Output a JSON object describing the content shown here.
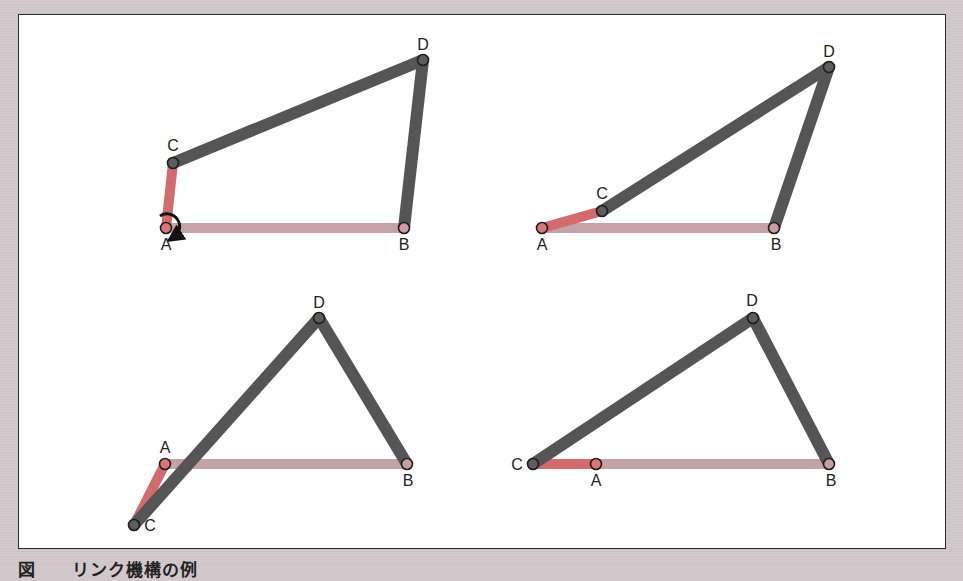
{
  "figure": {
    "caption": "図　　リンク機構の例",
    "colors": {
      "background": "#d3c9cc",
      "frame_bg": "#ffffff",
      "frame_border": "#2a2a2a",
      "fixed_link": "#c4a2a6",
      "crank_link": "#d26a6e",
      "moving_link": "#555555",
      "joint_moving": "#5c5c5c",
      "joint_fixed": "#c89ea3",
      "joint_crank": "#d9767a",
      "text": "#222222"
    },
    "panels": [
      {
        "id": "top-left",
        "joints": {
          "A": {
            "x": 166,
            "y": 228,
            "label": "A"
          },
          "B": {
            "x": 404,
            "y": 228,
            "label": "B"
          },
          "C": {
            "x": 173,
            "y": 163,
            "label": "C"
          },
          "D": {
            "x": 423,
            "y": 60,
            "label": "D"
          }
        },
        "rotation_arrow": true
      },
      {
        "id": "top-right",
        "joints": {
          "A": {
            "x": 542,
            "y": 228,
            "label": "A"
          },
          "B": {
            "x": 774,
            "y": 228,
            "label": "B"
          },
          "C": {
            "x": 602,
            "y": 211,
            "label": "C"
          },
          "D": {
            "x": 829,
            "y": 67,
            "label": "D"
          }
        }
      },
      {
        "id": "bottom-left",
        "joints": {
          "A": {
            "x": 165,
            "y": 464,
            "label": "A"
          },
          "B": {
            "x": 407,
            "y": 464,
            "label": "B"
          },
          "C": {
            "x": 134,
            "y": 525,
            "label": "C"
          },
          "D": {
            "x": 319,
            "y": 318,
            "label": "D"
          }
        }
      },
      {
        "id": "bottom-right",
        "joints": {
          "A": {
            "x": 596,
            "y": 464,
            "label": "A"
          },
          "B": {
            "x": 829,
            "y": 464,
            "label": "B"
          },
          "C": {
            "x": 533,
            "y": 464,
            "label": "C"
          },
          "D": {
            "x": 753,
            "y": 318,
            "label": "D"
          }
        }
      }
    ]
  }
}
